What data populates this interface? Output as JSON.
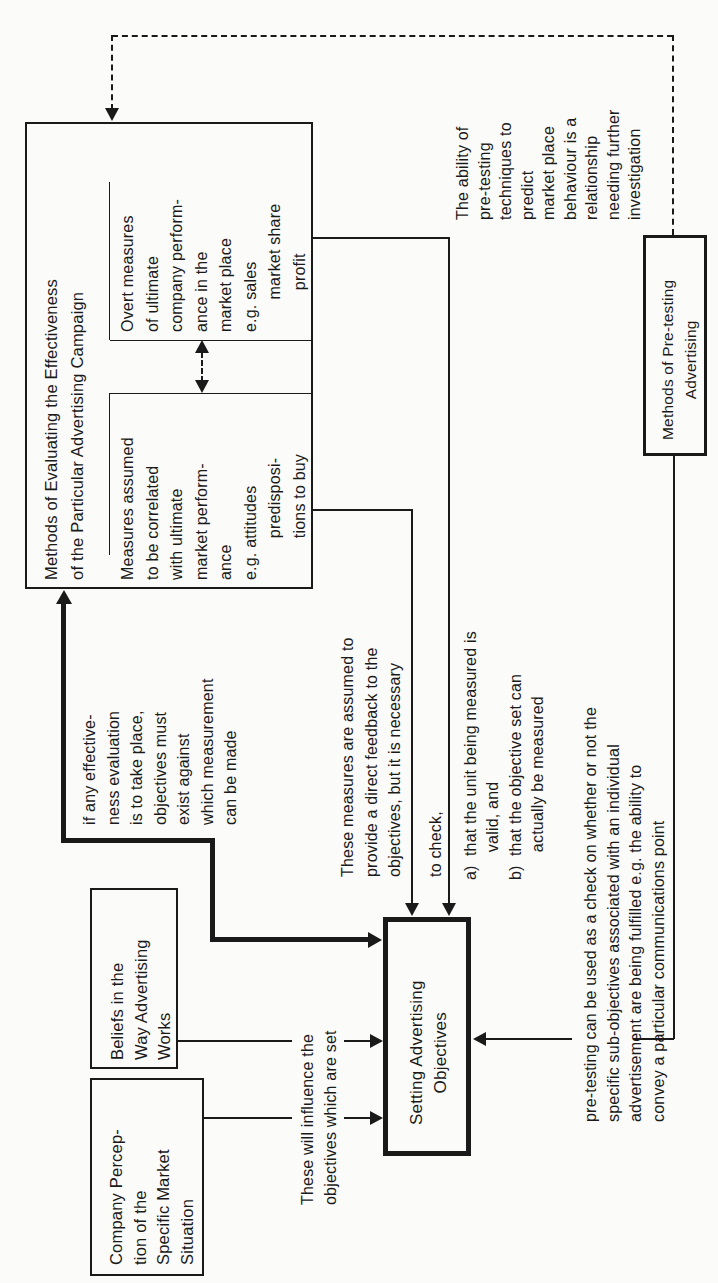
{
  "diagram": {
    "orientation": "rotated 90 degrees counter-clockwise",
    "nodes": {
      "evaluation_methods": {
        "title": "Methods of Evaluating the Effectiveness\nof the Particular Advertising Campaign",
        "overt_measures": "Overt measures\nof ultimate\ncompany perform-\nance in the\nmarket place\ne.g. sales\n       market share\n         profit",
        "assumed_measures": "Measures assumed\nto be correlated\nwith ultimate\nmarket perform-\nance\ne.g. attitudes\n         predisposi-\n         tions to buy"
      },
      "company_perception": "Company Percep-\ntion of the\nSpecific Market\nSituation",
      "beliefs": "Beliefs in the\nWay Advertising\nWorks",
      "setting_objectives": "Setting Advertising\nObjectives",
      "pretesting_methods": "Methods of Pre-testing\nAdvertising"
    },
    "annotations": {
      "influence": "These will influence the\nobjectives which are set",
      "effectiveness_condition": "if any effective-\nness evaluation\nis to take place,\nobjectives must\nexist against\nwhich measurement\ncan be made",
      "feedback_intro": "These measures are assumed to\nprovide a direct feedback to the\nobjectives, but it is necessary",
      "to_check": "to check,",
      "check_a": "a)  that the unit being measured is\n      valid, and",
      "check_b": "b)  that the objective set can\n      actually be measured",
      "pretesting_check": "pre-testing can be used as a check on whether or not the\nspecific sub-objectives associated with an individual\nadvertisement are being fulfilled e.g. the ability to\nconvey a particular communications point",
      "pretesting_ability": "The ability of\npre-testing\ntechniques to\npredict\nmarket place\nbehaviour is a\nrelationship\nneeding further\ninvestigation"
    },
    "edges": [
      {
        "from": "company_perception",
        "to": "setting_objectives",
        "style": "solid-thin"
      },
      {
        "from": "beliefs",
        "to": "setting_objectives",
        "style": "solid-thin"
      },
      {
        "from": "setting_objectives",
        "to": "evaluation_methods",
        "style": "solid-thick-bidirectional"
      },
      {
        "from": "assumed_measures",
        "to": "setting_objectives",
        "style": "solid-thin"
      },
      {
        "from": "overt_measures",
        "to": "setting_objectives",
        "style": "solid-thin"
      },
      {
        "from": "assumed_measures",
        "to": "overt_measures",
        "style": "dashed-bidirectional"
      },
      {
        "from": "pretesting_methods",
        "to": "setting_objectives",
        "style": "solid-thin"
      },
      {
        "from": "pretesting_methods",
        "to": "evaluation_methods",
        "style": "dashed"
      }
    ]
  }
}
